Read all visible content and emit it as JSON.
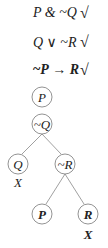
{
  "premises": [
    {
      "text": "P & ~Q",
      "check": "√"
    },
    {
      "text": "Q ∨ ~R",
      "check": "√"
    },
    {
      "text_neg": "~",
      "text_p": "P",
      "text_arrow": " → ",
      "text_r": "R",
      "check": "√"
    }
  ],
  "tree": {
    "nodes": [
      {
        "id": "n1",
        "label": "P",
        "bold": false
      },
      {
        "id": "n2",
        "label": "~Q",
        "bold": false
      },
      {
        "id": "n3",
        "label": "Q",
        "bold": false,
        "closed": "X"
      },
      {
        "id": "n4",
        "label": "~R",
        "bold": false
      },
      {
        "id": "n5",
        "label": "P",
        "bold": true
      },
      {
        "id": "n6",
        "label": "R",
        "bold": true,
        "closed": "X"
      }
    ]
  }
}
